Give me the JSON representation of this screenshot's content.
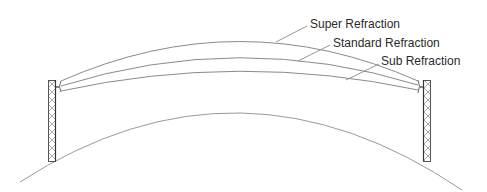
{
  "diagram": {
    "labels": {
      "super": "Super Refraction",
      "standard": "Standard Refraction",
      "sub": "Sub Refraction"
    },
    "elements": [
      "earth-curvature",
      "left-tower",
      "right-tower",
      "super-refraction-path",
      "standard-refraction-path",
      "sub-refraction-path"
    ],
    "colors": {
      "line": "#8a8a8a",
      "text": "#2a2a2a",
      "tower": "#555555",
      "background": "#ffffff"
    }
  }
}
